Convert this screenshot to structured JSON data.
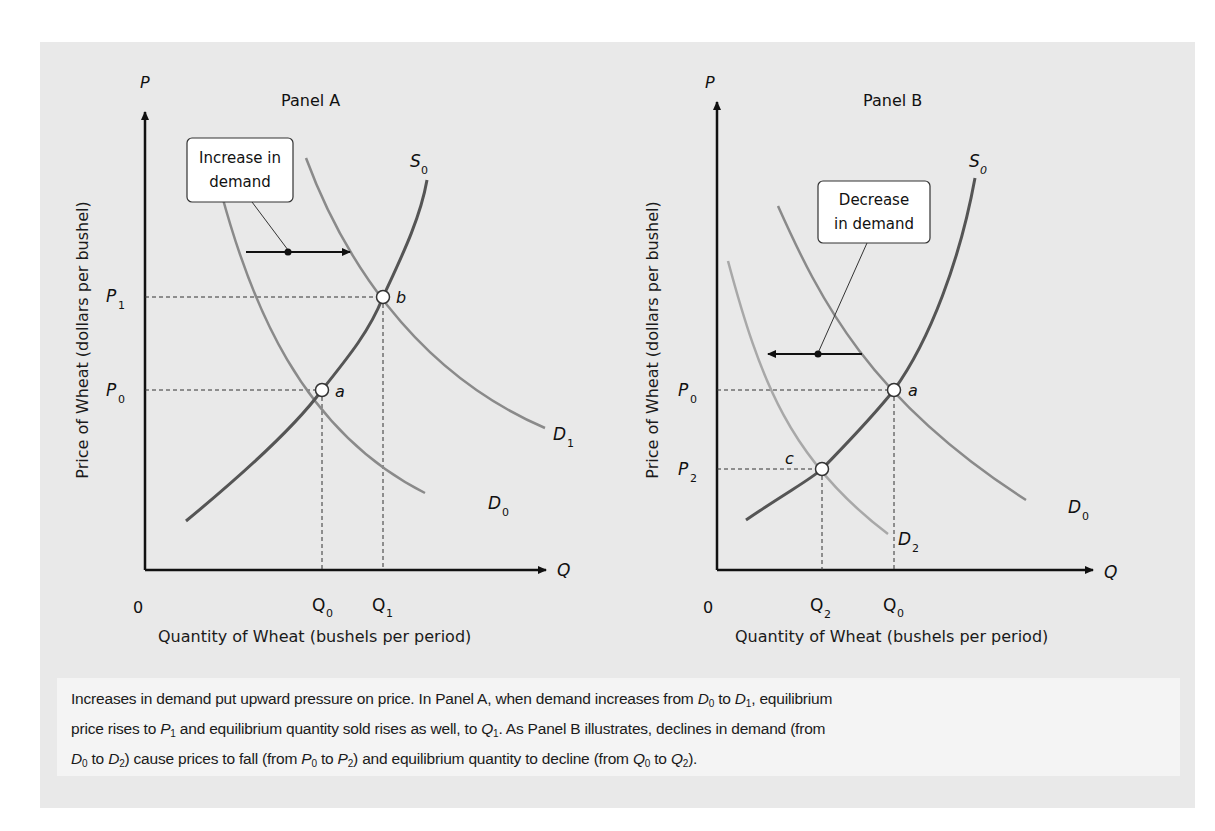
{
  "figure": {
    "top_cut_text": "",
    "caption": {
      "line1_a": "Increases in demand put upward pressure on price. In Panel A, when demand increases from ",
      "line1_b": " to ",
      "line1_c": ", equilibrium",
      "line2_a": "price rises to ",
      "line2_b": " and equilibrium quantity sold rises as well, to ",
      "line2_c": ".  As Panel B illustrates, declines in demand (from",
      "line3_a": " to ",
      "line3_b": ") cause prices to fall (from ",
      "line3_c": " to ",
      "line3_d": ") and equilibrium quantity to decline (from ",
      "line3_e": " to ",
      "line3_f": ").",
      "sym": {
        "D": "D",
        "P": "P",
        "Q": "Q",
        "s0": "0",
        "s1": "1",
        "s2": "2"
      }
    }
  },
  "panels": [
    {
      "title": "Panel A",
      "y_axis_symbol": "P",
      "x_axis_symbol": "Q",
      "origin": "0",
      "ylabel": "Price of Wheat (dollars per bushel)",
      "xlabel": "Quantity of Wheat (bushels per period)",
      "annotation": "Increase in demand",
      "annotation_line1": "Increase in",
      "annotation_line2": "demand",
      "price_labels": [
        {
          "sym": "P",
          "sub": "1"
        },
        {
          "sym": "P",
          "sub": "0"
        }
      ],
      "qty_labels": [
        {
          "sym": "Q",
          "sub": "0"
        },
        {
          "sym": "Q",
          "sub": "1"
        }
      ],
      "curve_labels": {
        "supply": {
          "sym": "S",
          "sub": "0"
        },
        "d_old": {
          "sym": "D",
          "sub": "0"
        },
        "d_new": {
          "sym": "D",
          "sub": "1"
        }
      },
      "points": [
        {
          "label": "a"
        },
        {
          "label": "b"
        }
      ]
    },
    {
      "title": "Panel B",
      "y_axis_symbol": "P",
      "x_axis_symbol": "Q",
      "origin": "0",
      "ylabel": "Price of Wheat (dollars per bushel)",
      "xlabel": "Quantity of Wheat (bushels per period)",
      "annotation": "Decrease in demand",
      "annotation_line1": "Decrease",
      "annotation_line2": "in demand",
      "price_labels": [
        {
          "sym": "P",
          "sub": "0"
        },
        {
          "sym": "P",
          "sub": "2"
        }
      ],
      "qty_labels": [
        {
          "sym": "Q",
          "sub": "2"
        },
        {
          "sym": "Q",
          "sub": "0"
        }
      ],
      "curve_labels": {
        "supply": {
          "sym": "S",
          "sub": "0"
        },
        "d_old": {
          "sym": "D",
          "sub": "0"
        },
        "d_new": {
          "sym": "D",
          "sub": "2"
        }
      },
      "points": [
        {
          "label": "a"
        },
        {
          "label": "c"
        }
      ]
    }
  ],
  "colors": {
    "background": "#e9e9e9",
    "caption_bg": "#f4f4f4",
    "supply": "#555555",
    "demand": "#8a8a8a",
    "demand_new_b": "#a8a8a8",
    "axis": "#111111"
  }
}
